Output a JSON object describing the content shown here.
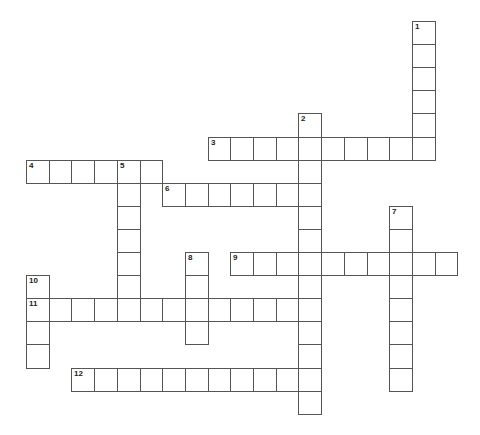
{
  "puzzle": {
    "type": "crossword",
    "grid": {
      "origin_x": 26,
      "origin_y": 21,
      "cell_width": 22.7,
      "cell_height": 23.1,
      "columns": 19,
      "rows": 17
    },
    "colors": {
      "background": "#ffffff",
      "cell_border": "#555555",
      "number_text": "#222222"
    },
    "entries": [
      {
        "number": "1",
        "direction": "down",
        "row": 0,
        "col": 17,
        "length": 6
      },
      {
        "number": "2",
        "direction": "down",
        "row": 4,
        "col": 12,
        "length": 13
      },
      {
        "number": "3",
        "direction": "across",
        "row": 5,
        "col": 8,
        "length": 10
      },
      {
        "number": "4",
        "direction": "across",
        "row": 6,
        "col": 0,
        "length": 6
      },
      {
        "number": "5",
        "direction": "down",
        "row": 6,
        "col": 4,
        "length": 7
      },
      {
        "number": "6",
        "direction": "across",
        "row": 7,
        "col": 6,
        "length": 7
      },
      {
        "number": "7",
        "direction": "down",
        "row": 8,
        "col": 16,
        "length": 8
      },
      {
        "number": "8",
        "direction": "down",
        "row": 10,
        "col": 7,
        "length": 4
      },
      {
        "number": "9",
        "direction": "across",
        "row": 10,
        "col": 9,
        "length": 10
      },
      {
        "number": "10",
        "direction": "down",
        "row": 11,
        "col": 0,
        "length": 4
      },
      {
        "number": "11",
        "direction": "across",
        "row": 12,
        "col": 0,
        "length": 13
      },
      {
        "number": "12",
        "direction": "across",
        "row": 15,
        "col": 2,
        "length": 11
      }
    ]
  }
}
